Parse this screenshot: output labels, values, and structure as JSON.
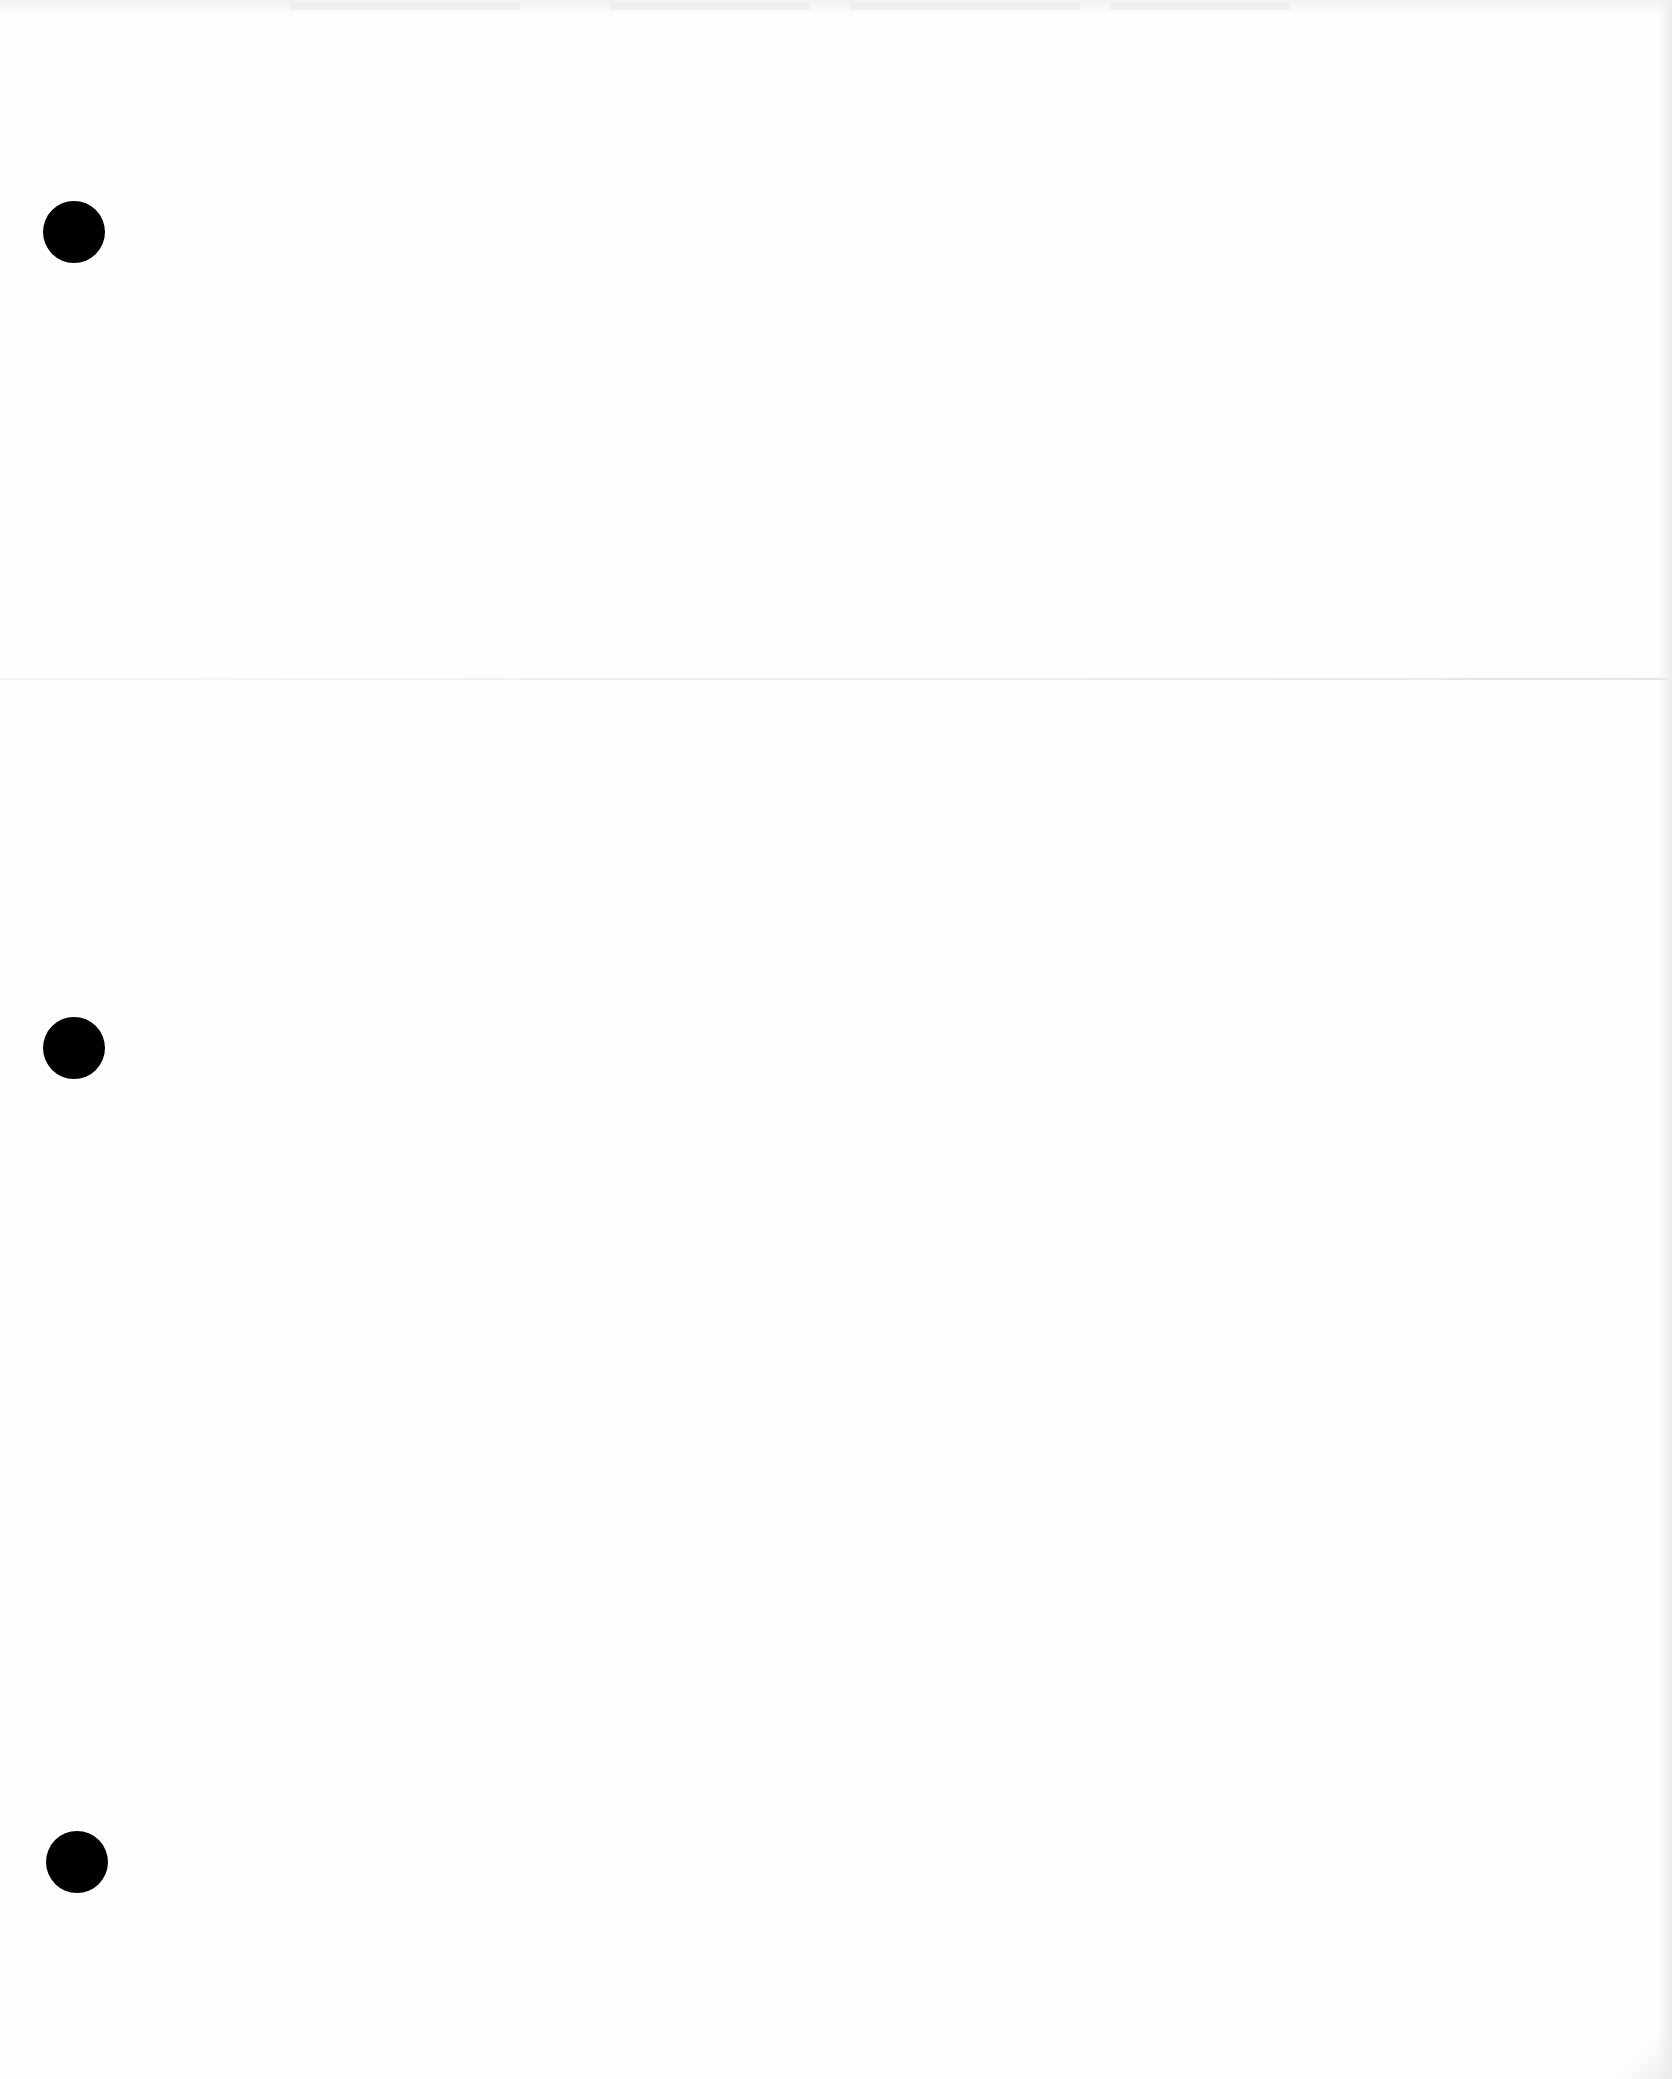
{
  "page": {
    "type": "blank three-hole-punched paper scan",
    "background_color": "#fefefe",
    "text_content": ""
  },
  "punch_holes": [
    {
      "id": "top",
      "cx": 74,
      "cy": 232,
      "diameter": 62,
      "color": "#000000"
    },
    {
      "id": "middle",
      "cx": 74,
      "cy": 1048,
      "diameter": 62,
      "color": "#000000"
    },
    {
      "id": "bottom",
      "cx": 77,
      "cy": 1862,
      "diameter": 62,
      "color": "#000000"
    }
  ],
  "fold_line": {
    "y": 678,
    "color": "#e6e6e6"
  }
}
